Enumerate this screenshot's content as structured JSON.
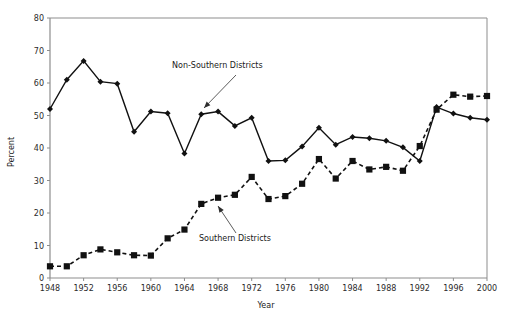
{
  "chart_data": {
    "type": "line",
    "title": "",
    "xlabel": "Year",
    "ylabel": "Percent",
    "xlim": [
      1948,
      2000
    ],
    "ylim": [
      0,
      80
    ],
    "ytick_values": [
      0,
      10,
      20,
      30,
      40,
      50,
      60,
      70,
      80
    ],
    "ytick_labels": [
      "0",
      "10",
      "20",
      "30",
      "40",
      "50",
      "60",
      "70",
      "80"
    ],
    "xtick_values": [
      1948,
      1952,
      1956,
      1960,
      1964,
      1968,
      1972,
      1976,
      1980,
      1984,
      1988,
      1992,
      1996,
      2000
    ],
    "xtick_labels": [
      "1948",
      "1952",
      "1956",
      "1960",
      "1964",
      "1968",
      "1972",
      "1976",
      "1980",
      "1984",
      "1988",
      "1992",
      "1996",
      "2000"
    ],
    "grid": false,
    "legend_position": "inline-annotations",
    "x": [
      1948,
      1950,
      1952,
      1954,
      1956,
      1958,
      1960,
      1962,
      1964,
      1966,
      1968,
      1970,
      1972,
      1974,
      1976,
      1978,
      1980,
      1982,
      1984,
      1986,
      1988,
      1990,
      1992,
      1994,
      1996,
      1998,
      2000
    ],
    "series": [
      {
        "name": "Non-Southern Districts",
        "marker": "diamond",
        "linestyle": "solid",
        "color": "#111111",
        "values": [
          52.0,
          61.0,
          66.8,
          60.4,
          59.8,
          45.0,
          51.2,
          50.7,
          38.3,
          50.4,
          51.2,
          46.8,
          49.3,
          36.0,
          36.2,
          40.5,
          46.2,
          41.0,
          43.4,
          43.0,
          42.2,
          40.2,
          36.0,
          52.6,
          50.6,
          49.3,
          48.7
        ]
      },
      {
        "name": "Southern Districts",
        "marker": "square",
        "linestyle": "dashed",
        "color": "#111111",
        "values": [
          3.6,
          3.6,
          7.0,
          8.8,
          7.9,
          7.0,
          6.9,
          12.2,
          14.9,
          22.8,
          24.7,
          25.6,
          31.1,
          24.3,
          25.2,
          29.0,
          36.6,
          30.6,
          36.0,
          33.4,
          34.2,
          33.0,
          40.6,
          51.8,
          56.4,
          55.8,
          56.0
        ]
      }
    ],
    "annotations": [
      {
        "text": "Non-Southern Districts",
        "text_x": 172,
        "text_y": 68,
        "arrow_from_x": 236,
        "arrow_from_y": 75,
        "arrow_to_x": 204,
        "arrow_to_y": 108
      },
      {
        "text": "Southern Districts",
        "text_x": 199,
        "text_y": 241,
        "arrow_from_x": 236,
        "arrow_from_y": 233,
        "arrow_to_x": 218,
        "arrow_to_y": 206
      }
    ],
    "axis_color": "#8d8d8d",
    "plot_area": {
      "left": 50,
      "top": 18,
      "right": 487,
      "bottom": 278
    }
  }
}
